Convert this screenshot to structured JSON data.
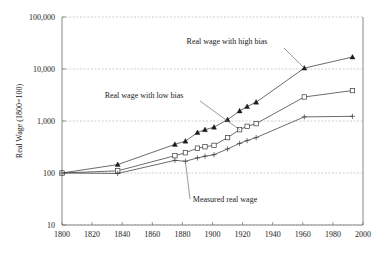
{
  "chart_data": {
    "type": "line",
    "title": "",
    "subtitle": "",
    "xlabel": "",
    "ylabel": "Real Wage (1800=100)",
    "xlim": [
      1800,
      2000
    ],
    "ylim": [
      10,
      100000
    ],
    "yscale": "log",
    "xscale": "linear",
    "grid": true,
    "grid_axis": "y",
    "legend_position": "inline-annotations",
    "x_ticks": [
      1800,
      1820,
      1840,
      1860,
      1880,
      1900,
      1920,
      1940,
      1960,
      1980,
      2000
    ],
    "x_tick_labels": [
      "1800",
      "1820",
      "1840",
      "1860",
      "1880",
      "1900",
      "1920",
      "1940",
      "1960",
      "1980",
      "2000"
    ],
    "y_ticks": [
      10,
      100,
      1000,
      10000,
      100000
    ],
    "y_tick_labels": [
      "10",
      "100",
      "1,000",
      "10,000",
      "100,000"
    ],
    "series": [
      {
        "name": "Real wage with high bias",
        "marker": "filled-triangle",
        "x": [
          1800,
          1837,
          1875,
          1882,
          1890,
          1895,
          1901,
          1910,
          1918,
          1923,
          1929,
          1961,
          1993
        ],
        "values": [
          100,
          145,
          355,
          410,
          600,
          680,
          760,
          1060,
          1560,
          1900,
          2300,
          10400,
          17000
        ]
      },
      {
        "name": "Real wage with low bias",
        "marker": "open-square",
        "x": [
          1800,
          1837,
          1875,
          1882,
          1890,
          1895,
          1901,
          1910,
          1918,
          1923,
          1929,
          1961,
          1993
        ],
        "values": [
          100,
          110,
          215,
          245,
          300,
          320,
          340,
          480,
          680,
          790,
          890,
          2900,
          3850
        ]
      },
      {
        "name": "Measured real wage",
        "marker": "plus",
        "x": [
          1800,
          1837,
          1875,
          1882,
          1890,
          1895,
          1901,
          1910,
          1918,
          1923,
          1929,
          1961,
          1993
        ],
        "values": [
          100,
          98,
          175,
          168,
          195,
          210,
          225,
          290,
          370,
          420,
          480,
          1200,
          1230
        ]
      }
    ],
    "annotations": [
      {
        "text": "Real wage with high bias",
        "points_to_series": "Real wage with high bias",
        "points_to_x": 1961
      },
      {
        "text": "Real wage with low bias",
        "points_to_series": "Real wage with low bias",
        "points_to_x": 1918
      },
      {
        "text": "Measured real wage",
        "points_to_series": "Measured real wage",
        "points_to_x": 1882
      }
    ]
  }
}
